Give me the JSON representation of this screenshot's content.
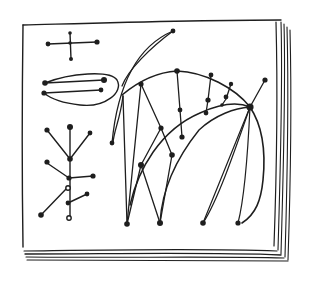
{
  "figure": {
    "colors": {
      "ink": "#1e1e1e",
      "paper": "#ffffff"
    },
    "elements": [
      {
        "name": "cross-graph",
        "shape": "plus with four dotted endpoints"
      },
      {
        "name": "loop-graph",
        "shape": "two parallel edges enclosed in a loop"
      },
      {
        "name": "tree-graph",
        "shape": "branching tree with leaf dots"
      },
      {
        "name": "lens-arc",
        "shape": "narrow crescent arc"
      },
      {
        "name": "arch-web",
        "shape": "arch mesh with radial and concentric edges converging on a hub"
      }
    ]
  }
}
